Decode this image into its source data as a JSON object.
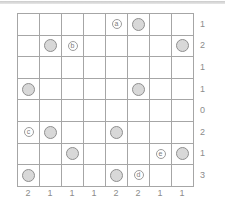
{
  "colors": {
    "line": "#a6a6a6",
    "circle_fill": "#d8d8d8",
    "circle_stroke": "#8f8f8f",
    "badge_stroke": "#9c9c9c",
    "badge_text": "#7d7d7d",
    "clue_text": "#8c8c8c",
    "top_divider": "#d2d2d2",
    "background": "#ffffff"
  },
  "board": {
    "rows": 8,
    "cols": 8,
    "circles": [
      {
        "row": 1,
        "col": 6
      },
      {
        "row": 2,
        "col": 2
      },
      {
        "row": 2,
        "col": 8
      },
      {
        "row": 4,
        "col": 1
      },
      {
        "row": 4,
        "col": 6
      },
      {
        "row": 6,
        "col": 2
      },
      {
        "row": 6,
        "col": 5
      },
      {
        "row": 7,
        "col": 3
      },
      {
        "row": 7,
        "col": 8
      },
      {
        "row": 8,
        "col": 1
      },
      {
        "row": 8,
        "col": 5
      }
    ],
    "labels": [
      {
        "row": 1,
        "col": 5,
        "text": "a"
      },
      {
        "row": 2,
        "col": 3,
        "text": "b"
      },
      {
        "row": 6,
        "col": 1,
        "text": "c"
      },
      {
        "row": 8,
        "col": 6,
        "text": "d"
      },
      {
        "row": 7,
        "col": 7,
        "text": "e"
      }
    ],
    "row_clues": [
      "1",
      "2",
      "1",
      "1",
      "0",
      "2",
      "1",
      "3"
    ],
    "col_clues": [
      "2",
      "1",
      "1",
      "1",
      "2",
      "2",
      "1",
      "1"
    ]
  }
}
